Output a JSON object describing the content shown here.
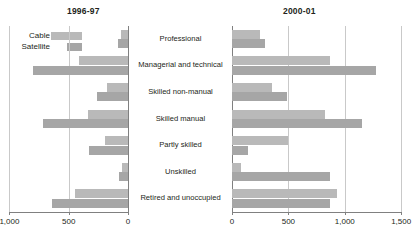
{
  "panels": {
    "left": {
      "title": "1996-97"
    },
    "right": {
      "title": "2000-01"
    }
  },
  "legend": {
    "items": [
      {
        "label": "Cable",
        "color": "#b9b9b9",
        "key": "cable"
      },
      {
        "label": "Satellite",
        "color": "#a6a6a6",
        "key": "satellite"
      }
    ]
  },
  "categories": [
    "Professional",
    "Managerial and technical",
    "Skilled non-manual",
    "Skilled manual",
    "Partly skilled",
    "Unskilled",
    "Retired and unoccupied"
  ],
  "axis": {
    "left_ticks": [
      "1,000",
      "500",
      "0"
    ],
    "left_tick_values": [
      1000,
      500,
      0
    ],
    "right_ticks": [
      "0",
      "500",
      "1,000",
      "1,500"
    ],
    "right_tick_values": [
      0,
      500,
      1000,
      1500
    ],
    "left_max": 1000,
    "right_max": 1500
  },
  "chart_data": {
    "type": "bar",
    "orientation": "horizontal",
    "layout": "back-to-back dual panel (mirrored left / right)",
    "title": "",
    "xlabel": "",
    "ylabel": "",
    "grid": true,
    "legend_position": "top-left",
    "categories": [
      "Professional",
      "Managerial and technical",
      "Skilled non-manual",
      "Skilled manual",
      "Partly skilled",
      "Unskilled",
      "Retired and unoccupied"
    ],
    "panels": [
      {
        "name": "1996-97",
        "axis_direction": "right-to-left",
        "xlim": [
          0,
          1000
        ],
        "xticks": [
          0,
          500,
          1000
        ],
        "series": [
          {
            "name": "Cable",
            "color": "#b9b9b9",
            "values": [
              55,
              410,
              180,
              340,
              195,
              50,
              450
            ]
          },
          {
            "name": "Satellite",
            "color": "#a6a6a6",
            "values": [
              85,
              805,
              265,
              720,
              330,
              75,
              645
            ]
          }
        ]
      },
      {
        "name": "2000-01",
        "axis_direction": "left-to-right",
        "xlim": [
          0,
          1500
        ],
        "xticks": [
          0,
          500,
          1000,
          1500
        ],
        "series": [
          {
            "name": "Cable",
            "color": "#b9b9b9",
            "values": [
              250,
              870,
              355,
              825,
              495,
              80,
              930
            ]
          },
          {
            "name": "Satellite",
            "color": "#a6a6a6",
            "values": [
              295,
              1280,
              490,
              1155,
              140,
              870,
              870
            ]
          }
        ]
      }
    ]
  }
}
